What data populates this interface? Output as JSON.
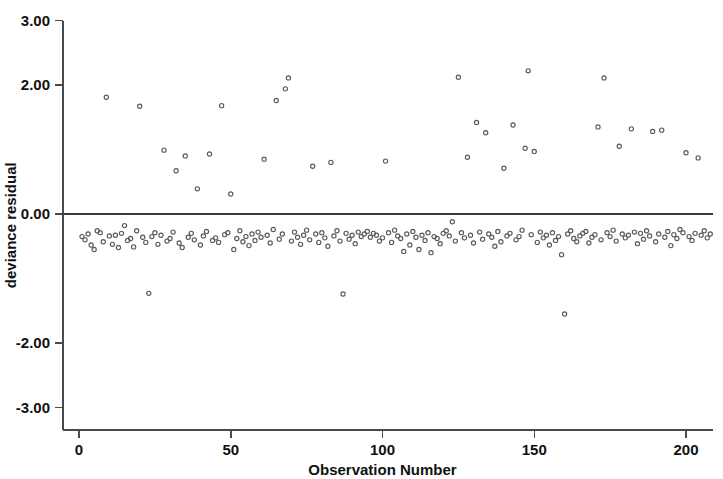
{
  "chart_data": {
    "type": "scatter",
    "title": "",
    "xlabel": "Observation Number",
    "ylabel": "deviance residual",
    "xlim": [
      -2,
      209
    ],
    "ylim": [
      -3.0,
      3.0
    ],
    "grid": false,
    "legend": "none",
    "marker": "open-circle",
    "marker_color": "#5a5a5a",
    "reference_lines": [
      {
        "axis": "y",
        "value": 0.0
      }
    ],
    "xticks": [
      0,
      50,
      100,
      150,
      200
    ],
    "xtick_labels": [
      "0",
      "50",
      "100",
      "150",
      "200"
    ],
    "yticks": [
      3.0,
      2.0,
      0.0,
      -2.0,
      -3.0
    ],
    "ytick_labels": [
      "3.00",
      "2.00",
      "0.00",
      "-2.00",
      "-3.00"
    ],
    "n_points": 208,
    "points": [
      [
        1,
        -0.35
      ],
      [
        2,
        -0.4
      ],
      [
        3,
        -0.31
      ],
      [
        4,
        -0.48
      ],
      [
        5,
        -0.55
      ],
      [
        6,
        -0.26
      ],
      [
        7,
        -0.29
      ],
      [
        8,
        -0.43
      ],
      [
        9,
        1.81
      ],
      [
        10,
        -0.34
      ],
      [
        11,
        -0.47
      ],
      [
        12,
        -0.33
      ],
      [
        13,
        -0.52
      ],
      [
        14,
        -0.3
      ],
      [
        15,
        -0.18
      ],
      [
        16,
        -0.41
      ],
      [
        17,
        -0.38
      ],
      [
        18,
        -0.51
      ],
      [
        19,
        -0.26
      ],
      [
        20,
        1.67
      ],
      [
        21,
        -0.36
      ],
      [
        22,
        -0.44
      ],
      [
        23,
        -1.23
      ],
      [
        24,
        -0.35
      ],
      [
        25,
        -0.29
      ],
      [
        26,
        -0.47
      ],
      [
        27,
        -0.33
      ],
      [
        28,
        0.99
      ],
      [
        29,
        -0.42
      ],
      [
        30,
        -0.38
      ],
      [
        31,
        -0.28
      ],
      [
        32,
        0.67
      ],
      [
        33,
        -0.45
      ],
      [
        34,
        -0.52
      ],
      [
        35,
        0.9
      ],
      [
        36,
        -0.36
      ],
      [
        37,
        -0.3
      ],
      [
        38,
        -0.4
      ],
      [
        39,
        0.39
      ],
      [
        40,
        -0.48
      ],
      [
        41,
        -0.34
      ],
      [
        42,
        -0.27
      ],
      [
        43,
        0.93
      ],
      [
        44,
        -0.41
      ],
      [
        45,
        -0.37
      ],
      [
        46,
        -0.44
      ],
      [
        47,
        1.68
      ],
      [
        48,
        -0.32
      ],
      [
        49,
        -0.29
      ],
      [
        50,
        0.31
      ],
      [
        51,
        -0.55
      ],
      [
        52,
        -0.38
      ],
      [
        53,
        -0.26
      ],
      [
        54,
        -0.43
      ],
      [
        55,
        -0.35
      ],
      [
        56,
        -0.49
      ],
      [
        57,
        -0.31
      ],
      [
        58,
        -0.41
      ],
      [
        59,
        -0.28
      ],
      [
        60,
        -0.36
      ],
      [
        61,
        0.85
      ],
      [
        62,
        -0.33
      ],
      [
        63,
        -0.45
      ],
      [
        64,
        -0.24
      ],
      [
        65,
        1.76
      ],
      [
        66,
        -0.39
      ],
      [
        67,
        -0.31
      ],
      [
        68,
        1.94
      ],
      [
        69,
        2.11
      ],
      [
        70,
        -0.42
      ],
      [
        71,
        -0.28
      ],
      [
        72,
        -0.36
      ],
      [
        73,
        -0.47
      ],
      [
        74,
        -0.33
      ],
      [
        75,
        -0.25
      ],
      [
        76,
        -0.4
      ],
      [
        77,
        0.74
      ],
      [
        78,
        -0.31
      ],
      [
        79,
        -0.44
      ],
      [
        80,
        -0.29
      ],
      [
        81,
        -0.37
      ],
      [
        82,
        -0.5
      ],
      [
        83,
        0.8
      ],
      [
        84,
        -0.34
      ],
      [
        85,
        -0.26
      ],
      [
        86,
        -0.42
      ],
      [
        87,
        -1.24
      ],
      [
        88,
        -0.3
      ],
      [
        89,
        -0.39
      ],
      [
        90,
        -0.33
      ],
      [
        91,
        -0.46
      ],
      [
        92,
        -0.28
      ],
      [
        93,
        -0.35
      ],
      [
        94,
        -0.31
      ],
      [
        95,
        -0.27
      ],
      [
        96,
        -0.36
      ],
      [
        97,
        -0.3
      ],
      [
        98,
        -0.33
      ],
      [
        99,
        -0.42
      ],
      [
        100,
        -0.37
      ],
      [
        101,
        0.82
      ],
      [
        102,
        -0.29
      ],
      [
        103,
        -0.44
      ],
      [
        104,
        -0.25
      ],
      [
        105,
        -0.34
      ],
      [
        106,
        -0.38
      ],
      [
        107,
        -0.58
      ],
      [
        108,
        -0.31
      ],
      [
        109,
        -0.48
      ],
      [
        110,
        -0.27
      ],
      [
        111,
        -0.36
      ],
      [
        112,
        -0.55
      ],
      [
        113,
        -0.33
      ],
      [
        114,
        -0.41
      ],
      [
        115,
        -0.29
      ],
      [
        116,
        -0.6
      ],
      [
        117,
        -0.35
      ],
      [
        118,
        -0.38
      ],
      [
        119,
        -0.46
      ],
      [
        120,
        -0.3
      ],
      [
        121,
        -0.26
      ],
      [
        122,
        -0.34
      ],
      [
        123,
        -0.12
      ],
      [
        124,
        -0.42
      ],
      [
        125,
        2.12
      ],
      [
        126,
        -0.29
      ],
      [
        127,
        -0.37
      ],
      [
        128,
        0.88
      ],
      [
        129,
        -0.33
      ],
      [
        130,
        -0.45
      ],
      [
        131,
        1.42
      ],
      [
        132,
        -0.28
      ],
      [
        133,
        -0.39
      ],
      [
        134,
        1.26
      ],
      [
        135,
        -0.31
      ],
      [
        136,
        -0.36
      ],
      [
        137,
        -0.5
      ],
      [
        138,
        -0.27
      ],
      [
        139,
        -0.43
      ],
      [
        140,
        0.71
      ],
      [
        141,
        -0.34
      ],
      [
        142,
        -0.3
      ],
      [
        143,
        1.38
      ],
      [
        144,
        -0.4
      ],
      [
        145,
        -0.35
      ],
      [
        146,
        -0.25
      ],
      [
        147,
        1.02
      ],
      [
        148,
        2.22
      ],
      [
        149,
        -0.32
      ],
      [
        150,
        0.97
      ],
      [
        151,
        -0.44
      ],
      [
        152,
        -0.28
      ],
      [
        153,
        -0.37
      ],
      [
        154,
        -0.33
      ],
      [
        155,
        -0.48
      ],
      [
        156,
        -0.29
      ],
      [
        157,
        -0.41
      ],
      [
        158,
        -0.35
      ],
      [
        159,
        -0.63
      ],
      [
        160,
        -1.55
      ],
      [
        161,
        -0.31
      ],
      [
        162,
        -0.26
      ],
      [
        163,
        -0.38
      ],
      [
        164,
        -0.43
      ],
      [
        165,
        -0.34
      ],
      [
        166,
        -0.3
      ],
      [
        167,
        -0.27
      ],
      [
        168,
        -0.45
      ],
      [
        169,
        -0.36
      ],
      [
        170,
        -0.32
      ],
      [
        171,
        1.35
      ],
      [
        172,
        -0.4
      ],
      [
        173,
        2.11
      ],
      [
        174,
        -0.29
      ],
      [
        175,
        -0.35
      ],
      [
        176,
        -0.25
      ],
      [
        177,
        -0.42
      ],
      [
        178,
        1.05
      ],
      [
        179,
        -0.31
      ],
      [
        180,
        -0.37
      ],
      [
        181,
        -0.33
      ],
      [
        182,
        1.32
      ],
      [
        183,
        -0.28
      ],
      [
        184,
        -0.46
      ],
      [
        185,
        -0.3
      ],
      [
        186,
        -0.39
      ],
      [
        187,
        -0.26
      ],
      [
        188,
        -0.34
      ],
      [
        189,
        1.28
      ],
      [
        190,
        -0.43
      ],
      [
        191,
        -0.31
      ],
      [
        192,
        1.3
      ],
      [
        193,
        -0.36
      ],
      [
        194,
        -0.27
      ],
      [
        195,
        -0.49
      ],
      [
        196,
        -0.32
      ],
      [
        197,
        -0.38
      ],
      [
        198,
        -0.24
      ],
      [
        199,
        -0.29
      ],
      [
        200,
        0.95
      ],
      [
        201,
        -0.35
      ],
      [
        202,
        -0.41
      ],
      [
        203,
        -0.3
      ],
      [
        204,
        0.87
      ],
      [
        205,
        -0.33
      ],
      [
        206,
        -0.26
      ],
      [
        207,
        -0.37
      ],
      [
        208,
        -0.31
      ]
    ]
  }
}
